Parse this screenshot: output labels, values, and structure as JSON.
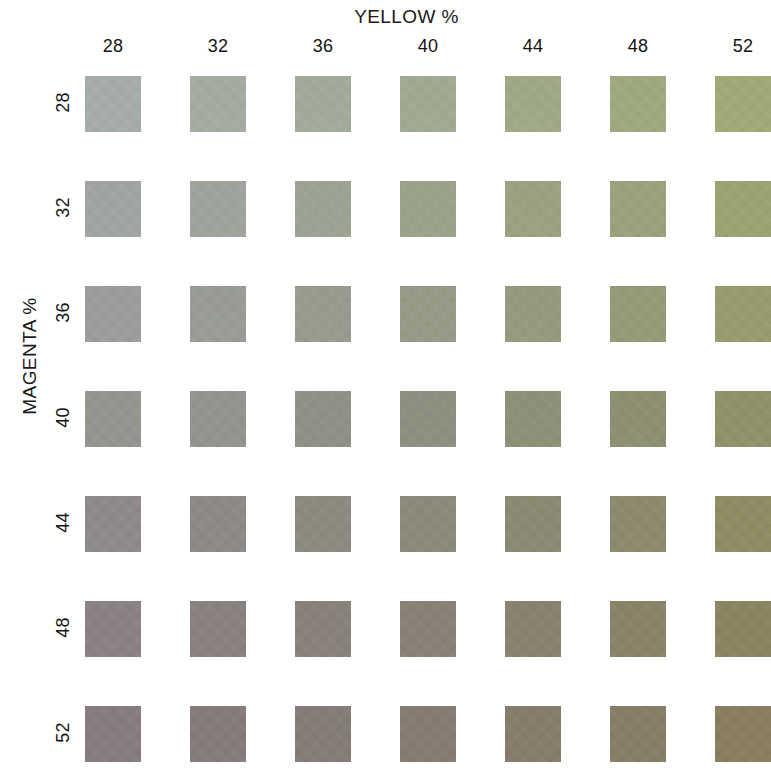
{
  "chart_title": "YELLOW %",
  "axes": {
    "x_title": "YELLOW %",
    "y_title": "MAGENTA %"
  },
  "chart_data": {
    "type": "heatmap",
    "title": "YELLOW %",
    "xlabel": "YELLOW %",
    "ylabel": "MAGENTA %",
    "grid": false,
    "legend": "none",
    "x": [
      28,
      32,
      36,
      40,
      44,
      48,
      52
    ],
    "y": [
      28,
      32,
      36,
      40,
      44,
      48,
      52
    ],
    "x_tick_labels": [
      "28",
      "32",
      "36",
      "40",
      "44",
      "48",
      "52"
    ],
    "y_tick_labels": [
      "28",
      "32",
      "36",
      "40",
      "44",
      "48",
      "52"
    ],
    "cell_unit": "ink coverage percent",
    "colors": [
      [
        "#a8afab",
        "#a6aea4",
        "#a4ad9b",
        "#a2ac92",
        "#a1ab88",
        "#a0ab80",
        "#a2ac76"
      ],
      [
        "#a2a7a4",
        "#a0a69d",
        "#9fa594",
        "#9da48c",
        "#9ca483",
        "#9ba47b",
        "#9da571"
      ],
      [
        "#9c9f9d",
        "#9a9e96",
        "#999d8e",
        "#989c86",
        "#979c7e",
        "#979c76",
        "#999d6d"
      ],
      [
        "#95968f",
        "#949590",
        "#8f9287",
        "#8e9180",
        "#8e9178",
        "#8e9170",
        "#909368"
      ],
      [
        "#908a8a",
        "#8e8a85",
        "#8d8a80",
        "#8c8a79",
        "#8c8a72",
        "#8d8b6b",
        "#8f8d63"
      ],
      [
        "#8a8284",
        "#898280",
        "#89827b",
        "#898275",
        "#89826f",
        "#8a8368",
        "#8c8560"
      ],
      [
        "#877b7f",
        "#867b7b",
        "#867b77",
        "#867b71",
        "#877c6b",
        "#887d65",
        "#8a7f5d"
      ]
    ],
    "cells": [
      {
        "magenta": 28,
        "yellow": 28,
        "color": "#a8afab"
      },
      {
        "magenta": 28,
        "yellow": 32,
        "color": "#a6aea4"
      },
      {
        "magenta": 28,
        "yellow": 36,
        "color": "#a4ad9b"
      },
      {
        "magenta": 28,
        "yellow": 40,
        "color": "#a2ac92"
      },
      {
        "magenta": 28,
        "yellow": 44,
        "color": "#a1ab88"
      },
      {
        "magenta": 28,
        "yellow": 48,
        "color": "#a0ab80"
      },
      {
        "magenta": 28,
        "yellow": 52,
        "color": "#a2ac76"
      },
      {
        "magenta": 32,
        "yellow": 28,
        "color": "#a2a7a4"
      },
      {
        "magenta": 32,
        "yellow": 32,
        "color": "#a0a69d"
      },
      {
        "magenta": 32,
        "yellow": 36,
        "color": "#9fa594"
      },
      {
        "magenta": 32,
        "yellow": 40,
        "color": "#9da48c"
      },
      {
        "magenta": 32,
        "yellow": 44,
        "color": "#9ca483"
      },
      {
        "magenta": 32,
        "yellow": 48,
        "color": "#9ba47b"
      },
      {
        "magenta": 32,
        "yellow": 52,
        "color": "#9da571"
      },
      {
        "magenta": 36,
        "yellow": 28,
        "color": "#9c9f9d"
      },
      {
        "magenta": 36,
        "yellow": 32,
        "color": "#9a9e96"
      },
      {
        "magenta": 36,
        "yellow": 36,
        "color": "#999d8e"
      },
      {
        "magenta": 36,
        "yellow": 40,
        "color": "#989c86"
      },
      {
        "magenta": 36,
        "yellow": 44,
        "color": "#979c7e"
      },
      {
        "magenta": 36,
        "yellow": 48,
        "color": "#979c76"
      },
      {
        "magenta": 36,
        "yellow": 52,
        "color": "#999d6d"
      },
      {
        "magenta": 40,
        "yellow": 28,
        "color": "#95968f"
      },
      {
        "magenta": 40,
        "yellow": 32,
        "color": "#949590"
      },
      {
        "magenta": 40,
        "yellow": 36,
        "color": "#8f9287"
      },
      {
        "magenta": 40,
        "yellow": 40,
        "color": "#8e9180"
      },
      {
        "magenta": 40,
        "yellow": 44,
        "color": "#8e9178"
      },
      {
        "magenta": 40,
        "yellow": 48,
        "color": "#8e9170"
      },
      {
        "magenta": 40,
        "yellow": 52,
        "color": "#909368"
      },
      {
        "magenta": 44,
        "yellow": 28,
        "color": "#908a8a"
      },
      {
        "magenta": 44,
        "yellow": 32,
        "color": "#8e8a85"
      },
      {
        "magenta": 44,
        "yellow": 36,
        "color": "#8d8a80"
      },
      {
        "magenta": 44,
        "yellow": 40,
        "color": "#8c8a79"
      },
      {
        "magenta": 44,
        "yellow": 44,
        "color": "#8c8a72"
      },
      {
        "magenta": 44,
        "yellow": 48,
        "color": "#8d8b6b"
      },
      {
        "magenta": 44,
        "yellow": 52,
        "color": "#8f8d63"
      },
      {
        "magenta": 48,
        "yellow": 28,
        "color": "#8a8284"
      },
      {
        "magenta": 48,
        "yellow": 32,
        "color": "#898280"
      },
      {
        "magenta": 48,
        "yellow": 36,
        "color": "#89827b"
      },
      {
        "magenta": 48,
        "yellow": 40,
        "color": "#898275"
      },
      {
        "magenta": 48,
        "yellow": 44,
        "color": "#89826f"
      },
      {
        "magenta": 48,
        "yellow": 48,
        "color": "#8a8368"
      },
      {
        "magenta": 48,
        "yellow": 52,
        "color": "#8c8560"
      },
      {
        "magenta": 52,
        "yellow": 28,
        "color": "#877b7f"
      },
      {
        "magenta": 52,
        "yellow": 32,
        "color": "#867b7b"
      },
      {
        "magenta": 52,
        "yellow": 36,
        "color": "#867b77"
      },
      {
        "magenta": 52,
        "yellow": 40,
        "color": "#867b71"
      },
      {
        "magenta": 52,
        "yellow": 44,
        "color": "#877c6b"
      },
      {
        "magenta": 52,
        "yellow": 48,
        "color": "#887d65"
      },
      {
        "magenta": 52,
        "yellow": 52,
        "color": "#8a7f5d"
      }
    ]
  },
  "layout": {
    "grid_origin_x": 85,
    "grid_origin_y": 76,
    "cell_size": 56,
    "pitch_x": 105,
    "pitch_y": 105
  }
}
